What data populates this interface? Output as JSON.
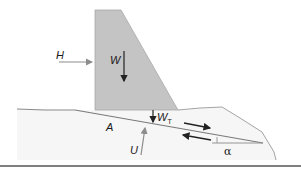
{
  "diagram": {
    "labels": {
      "H": "H",
      "W": "W",
      "WT_main": "W",
      "WT_sub": "T",
      "A": "A",
      "U": "U",
      "alpha": "α"
    },
    "colors": {
      "dam_fill": "#c4c4c4",
      "dam_edge": "#9a9a9a",
      "ground_fill": "#f4f4f4",
      "ground_line": "#8a8a8a",
      "arrow_dark": "#222222",
      "arrow_gray": "#8c8c8c",
      "baseline": "#555555"
    },
    "elements": [
      {
        "name": "dam",
        "description": "Gray trapezoidal gravity dam, vertical upstream face, sloped downstream face"
      },
      {
        "name": "H",
        "description": "Horizontal water pressure force pointing right on upstream face"
      },
      {
        "name": "W",
        "description": "Dam self-weight acting vertically downward"
      },
      {
        "name": "W_T",
        "description": "Weight component at foundation, downward arrow"
      },
      {
        "name": "A",
        "description": "Sliding plane/contact area label"
      },
      {
        "name": "U",
        "description": "Uplift force acting upward on base"
      },
      {
        "name": "shear-arrows",
        "description": "Opposing arrows along inclined plane indicating sliding direction"
      },
      {
        "name": "alpha",
        "description": "Inclination angle of the sliding plane"
      }
    ]
  }
}
